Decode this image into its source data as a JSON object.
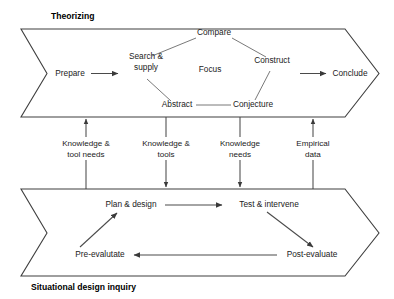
{
  "diagram": {
    "type": "process-flow",
    "title_top": "Theorizing",
    "title_bottom": "Situational design inquiry",
    "stroke_color": "#3f3f3f",
    "line_color": "#4a4a4a",
    "background": "#ffffff",
    "text_color": "#222222"
  },
  "theorizing": {
    "label": "Theorizing",
    "entry": {
      "label": "Prepare"
    },
    "exit": {
      "label": "Conclude"
    },
    "cycle": {
      "top": {
        "label": "Compare"
      },
      "left": {
        "label": "Search &",
        "label2": "supply"
      },
      "right": {
        "label": "Construct"
      },
      "bottom_left": {
        "label": "Abstract"
      },
      "bottom_right": {
        "label": "Conjecture"
      },
      "center": {
        "label": "Focus"
      }
    }
  },
  "inquiry": {
    "label": "Situational design inquiry",
    "nodes": {
      "plan": {
        "label": "Plan & design"
      },
      "test": {
        "label": "Test & intervene"
      },
      "post": {
        "label": "Post-evaluate"
      },
      "pre": {
        "label": "Pre-evalutate"
      }
    }
  },
  "channels": [
    {
      "line1": "Knowledge &",
      "line2": "tool needs",
      "direction": "up"
    },
    {
      "line1": "Knowledge &",
      "line2": "tools",
      "direction": "down"
    },
    {
      "line1": "Knowledge",
      "line2": "needs",
      "direction": "down"
    },
    {
      "line1": "Empirical",
      "line2": "data",
      "direction": "up"
    }
  ]
}
